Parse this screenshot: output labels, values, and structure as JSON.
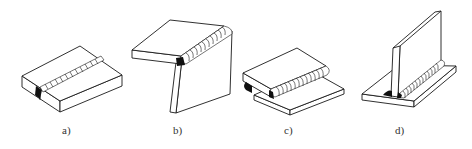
{
  "figure": {
    "panels": [
      {
        "id": "a",
        "label": "a)",
        "joint": "butt-joint"
      },
      {
        "id": "b",
        "label": "b)",
        "joint": "corner-joint"
      },
      {
        "id": "c",
        "label": "c)",
        "joint": "lap-joint"
      },
      {
        "id": "d",
        "label": "d)",
        "joint": "t-joint"
      }
    ]
  },
  "colors": {
    "line": "#1a1a1a",
    "background": "#ffffff",
    "weld_root": "#111111",
    "label": "#333333"
  }
}
